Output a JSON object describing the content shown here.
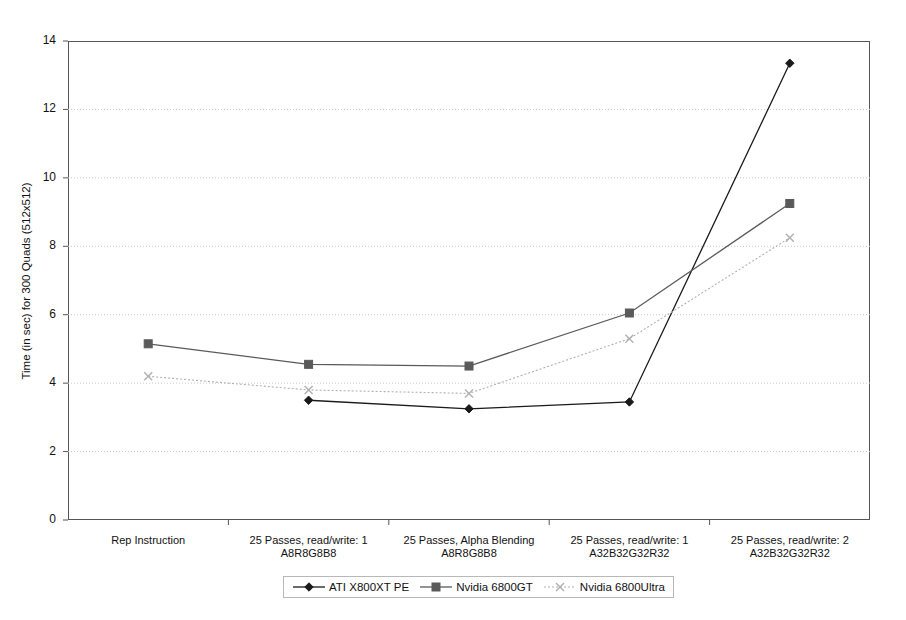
{
  "chart_data": {
    "type": "line",
    "title": "",
    "xlabel": "",
    "ylabel": "Time (in sec) for 300 Quads (512x512)",
    "ylim": [
      0,
      14
    ],
    "yticks": [
      0,
      2,
      4,
      6,
      8,
      10,
      12,
      14
    ],
    "ytick_labels": [
      "0",
      "2",
      "4",
      "6",
      "8",
      "10",
      "12",
      "14"
    ],
    "grid": "horizontal-dotted",
    "legend_position": "bottom",
    "categories": [
      "Rep Instruction",
      "25 Passes, read/write: 1\nA8R8G8B8",
      "25 Passes, Alpha Blending\nA8R8G8B8",
      "25 Passes, read/write: 1\nA32B32G32R32",
      "25 Passes, read/write: 2\nA32B32G32R32"
    ],
    "category_lines": [
      [
        "Rep Instruction",
        ""
      ],
      [
        "25 Passes, read/write: 1",
        "A8R8G8B8"
      ],
      [
        "25 Passes, Alpha Blending",
        "A8R8G8B8"
      ],
      [
        "25 Passes, read/write: 1",
        "A32B32G32R32"
      ],
      [
        "25 Passes, read/write: 2",
        "A32B32G32R32"
      ]
    ],
    "series": [
      {
        "name": "ATI X800XT PE",
        "color": "#1a1a1a",
        "marker": "diamond",
        "line_style": "solid",
        "values": [
          null,
          3.5,
          3.25,
          3.45,
          13.35
        ]
      },
      {
        "name": "Nvidia 6800GT",
        "color": "#5a5a5a",
        "marker": "square",
        "line_style": "solid",
        "values": [
          5.15,
          4.55,
          4.5,
          6.05,
          9.25
        ]
      },
      {
        "name": "Nvidia 6800Ultra",
        "color": "#b0b0b0",
        "marker": "cross",
        "line_style": "dotted",
        "values": [
          4.2,
          3.8,
          3.7,
          5.3,
          8.25
        ]
      }
    ]
  },
  "legend": {
    "entries": [
      {
        "label": "ATI X800XT PE"
      },
      {
        "label": "Nvidia 6800GT"
      },
      {
        "label": "Nvidia 6800Ultra"
      }
    ]
  }
}
